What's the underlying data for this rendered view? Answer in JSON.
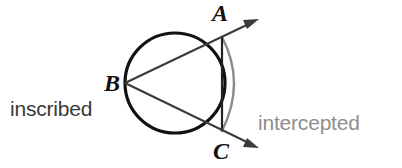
{
  "diagram": {
    "background_color": "#ffffff",
    "labels": {
      "inscribed_angle_line1": "inscribed",
      "inscribed_angle_line2": "angle",
      "intercepted_arc_line1": "intercepted",
      "intercepted_arc_line2": "arc",
      "inscribed_angle_color": "#3a3a3a",
      "intercepted_arc_color": "#8e8e8e"
    },
    "vertices": {
      "a": "A",
      "b": "B",
      "c": "C"
    },
    "colors": {
      "circle_stroke": "#111111",
      "chord_stroke": "#222222",
      "ray_stroke": "#3b3b3b",
      "arc_stroke": "#8a8a8a",
      "label_dark": "#3a3a3a",
      "label_gray": "#8e8e8e",
      "vertex_label": "#111111"
    },
    "geometry": {
      "circle_center_x": 175,
      "circle_center_y": 83,
      "circle_radius": 50,
      "point_a_x": 222,
      "point_a_y": 37,
      "point_b_x": 125,
      "point_b_y": 83,
      "point_c_x": 222,
      "point_c_y": 131,
      "ray_a_tip_x": 258,
      "ray_a_tip_y": 20,
      "ray_c_tip_x": 258,
      "ray_c_tip_y": 148,
      "arc_bulge_x": 243
    }
  }
}
